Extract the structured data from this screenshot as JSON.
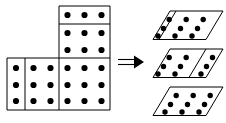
{
  "figure": {
    "background_color": "#ffffff",
    "ink_color": "#000000",
    "width": 226,
    "height": 123
  },
  "source_shape": {
    "name": "L-shaped polyomino dot grid",
    "total_dots": 36,
    "grid_columns": 6,
    "grid_rows": 6,
    "dot_spacing_x": 17,
    "dot_spacing_y": 17,
    "regions": [
      {
        "name": "top-strip",
        "label": "top single row piece",
        "x": 59,
        "y": 6,
        "width": 51,
        "height": 18,
        "dot_cols": 3,
        "dot_rows": 1,
        "dots": 3
      },
      {
        "name": "upper-block",
        "label": "upper two-row piece",
        "x": 59,
        "y": 24,
        "width": 51,
        "height": 34,
        "dot_cols": 3,
        "dot_rows": 2,
        "dots": 6
      },
      {
        "name": "bottom-left-column",
        "label": "bottom single column piece",
        "x": 7,
        "y": 58,
        "width": 18,
        "height": 52,
        "dot_cols": 1,
        "dot_rows": 3,
        "dots": 3
      },
      {
        "name": "bottom-middle-block",
        "label": "bottom two-column piece",
        "x": 25,
        "y": 58,
        "width": 34,
        "height": 52,
        "dot_cols": 2,
        "dot_rows": 3,
        "dots": 6
      },
      {
        "name": "bottom-right-block",
        "label": "bottom three-column piece",
        "x": 59,
        "y": 58,
        "width": 51,
        "height": 52,
        "dot_cols": 3,
        "dot_rows": 3,
        "dots": 9
      }
    ]
  },
  "arrow": {
    "name": "double-stroke-right-arrow",
    "glyph": "=>",
    "x": 118,
    "y": 57,
    "length": 26,
    "label": "implies"
  },
  "result_shapes": [
    {
      "name": "parallelogram-top",
      "index": 1,
      "dot_cols": 3,
      "dot_rows": 3,
      "dots": 9,
      "divider_after_column": 1,
      "split": "1 + 2",
      "origin_x": 153,
      "origin_y": 11
    },
    {
      "name": "parallelogram-middle",
      "index": 2,
      "dot_cols": 3,
      "dot_rows": 3,
      "dots": 9,
      "divider_after_column": 2,
      "split": "2 + 1",
      "origin_x": 153,
      "origin_y": 49
    },
    {
      "name": "parallelogram-bottom",
      "index": 3,
      "dot_cols": 3,
      "dot_rows": 3,
      "dots": 9,
      "divider_after_column": 0,
      "split": "3",
      "origin_x": 153,
      "origin_y": 87
    }
  ],
  "parallelogram_geometry": {
    "cell_width": 19,
    "cell_height": 9.5,
    "skew_x": 17,
    "rows": 3,
    "cols": 3
  }
}
